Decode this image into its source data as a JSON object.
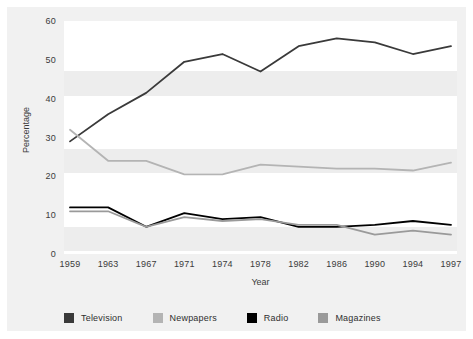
{
  "top_partial_text": "",
  "axes": {
    "y_title": "Percentage",
    "x_title": "Year",
    "y_ticks": [
      "0",
      "10",
      "20",
      "30",
      "40",
      "50",
      "60"
    ],
    "x_ticks": [
      "1959",
      "1963",
      "1967",
      "1971",
      "1974",
      "1978",
      "1982",
      "1986",
      "1990",
      "1994",
      "1997"
    ]
  },
  "legend": {
    "items": [
      {
        "label": "Television",
        "color": "#3a3a3a"
      },
      {
        "label": "Newpapers",
        "color": "#b4b4b4"
      },
      {
        "label": "Radio",
        "color": "#000000"
      },
      {
        "label": "Magazines",
        "color": "#9a9a9a"
      }
    ]
  },
  "chart_data": {
    "type": "line",
    "title": "",
    "xlabel": "Year",
    "ylabel": "Percentage",
    "x": [
      "1959",
      "1963",
      "1967",
      "1971",
      "1974",
      "1978",
      "1982",
      "1986",
      "1990",
      "1994",
      "1997"
    ],
    "ylim": [
      0,
      60
    ],
    "ytick_step": 10,
    "grid": "horizontal-bands",
    "legend_position": "bottom",
    "series": [
      {
        "name": "Television",
        "color": "#3a3a3a",
        "values": [
          29,
          36,
          41.5,
          49.5,
          51.5,
          47,
          53.5,
          55.5,
          54.5,
          51.5,
          53.5
        ]
      },
      {
        "name": "Newpapers",
        "color": "#b4b4b4",
        "values": [
          32,
          24,
          24,
          20.5,
          20.5,
          23,
          22.5,
          22,
          22,
          21.5,
          23.5
        ]
      },
      {
        "name": "Radio",
        "color": "#000000",
        "values": [
          12,
          12,
          7,
          10.5,
          9,
          9.5,
          7,
          7,
          7.5,
          8.5,
          7.5
        ]
      },
      {
        "name": "Magazines",
        "color": "#9a9a9a",
        "values": [
          11,
          11,
          7,
          9.5,
          8.5,
          9,
          7.5,
          7.5,
          5,
          6,
          5
        ]
      }
    ]
  }
}
